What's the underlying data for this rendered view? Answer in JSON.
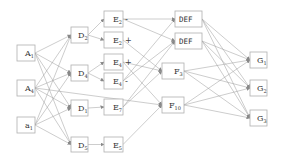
{
  "diagram": {
    "nodes": [
      {
        "id": "A1",
        "base": "A",
        "sub": "1",
        "sign": "",
        "column": 0
      },
      {
        "id": "A4",
        "base": "A",
        "sub": "4",
        "sign": "",
        "column": 0
      },
      {
        "id": "a1",
        "base": "a",
        "sub": "1",
        "sign": "",
        "column": 0
      },
      {
        "id": "D2",
        "base": "D",
        "sub": "2",
        "sign": "",
        "column": 1
      },
      {
        "id": "D4",
        "base": "D",
        "sub": "4",
        "sign": "",
        "column": 1
      },
      {
        "id": "D1",
        "base": "D",
        "sub": "1",
        "sign": "",
        "column": 1
      },
      {
        "id": "D5",
        "base": "D",
        "sub": "5",
        "sign": "",
        "column": 1
      },
      {
        "id": "E2m",
        "base": "E",
        "sub": "2",
        "sign": "-",
        "column": 2
      },
      {
        "id": "E2p",
        "base": "E",
        "sub": "2",
        "sign": "+",
        "column": 2
      },
      {
        "id": "E4p",
        "base": "E",
        "sub": "4",
        "sign": "+",
        "column": 2
      },
      {
        "id": "E4m",
        "base": "E",
        "sub": "4",
        "sign": "-",
        "column": 2
      },
      {
        "id": "E7",
        "base": "E",
        "sub": "7",
        "sign": "",
        "column": 2
      },
      {
        "id": "E5",
        "base": "E",
        "sub": "5",
        "sign": "",
        "column": 2
      },
      {
        "id": "DEF1",
        "base": "DEF",
        "sub": "",
        "sign": "",
        "column": 3
      },
      {
        "id": "DEF2",
        "base": "DEF",
        "sub": "",
        "sign": "",
        "column": 3
      },
      {
        "id": "F3",
        "base": "F",
        "sub": "3",
        "sign": "",
        "column": 3
      },
      {
        "id": "F10",
        "base": "F",
        "sub": "10",
        "sign": "",
        "column": 3
      },
      {
        "id": "G1",
        "base": "G",
        "sub": "1",
        "sign": "",
        "column": 4
      },
      {
        "id": "G2",
        "base": "G",
        "sub": "2",
        "sign": "",
        "column": 4
      },
      {
        "id": "G3",
        "base": "G",
        "sub": "3",
        "sign": "",
        "column": 4
      }
    ],
    "edges": [
      [
        "A1",
        "D2"
      ],
      [
        "A1",
        "D4"
      ],
      [
        "A1",
        "D1"
      ],
      [
        "A1",
        "D5"
      ],
      [
        "A4",
        "D2"
      ],
      [
        "A4",
        "D4"
      ],
      [
        "A4",
        "D1"
      ],
      [
        "A4",
        "D5"
      ],
      [
        "A4",
        "F10"
      ],
      [
        "a1",
        "D2"
      ],
      [
        "a1",
        "D4"
      ],
      [
        "a1",
        "D1"
      ],
      [
        "a1",
        "D5"
      ],
      [
        "D2",
        "E2m"
      ],
      [
        "D2",
        "E2p"
      ],
      [
        "D4",
        "E4p"
      ],
      [
        "D4",
        "E4m"
      ],
      [
        "D1",
        "E7"
      ],
      [
        "D5",
        "E5"
      ],
      [
        "E2m",
        "DEF1"
      ],
      [
        "E2m",
        "DEF2"
      ],
      [
        "E2p",
        "F3"
      ],
      [
        "E4p",
        "F3"
      ],
      [
        "E4p",
        "F10"
      ],
      [
        "E4m",
        "DEF1"
      ],
      [
        "E4m",
        "DEF2"
      ],
      [
        "E7",
        "DEF2"
      ],
      [
        "E7",
        "F3"
      ],
      [
        "E5",
        "F10"
      ],
      [
        "DEF1",
        "G1"
      ],
      [
        "DEF1",
        "G2"
      ],
      [
        "DEF1",
        "G3"
      ],
      [
        "DEF2",
        "G1"
      ],
      [
        "DEF2",
        "G2"
      ],
      [
        "DEF2",
        "G3"
      ],
      [
        "F3",
        "G1"
      ],
      [
        "F3",
        "G2"
      ],
      [
        "F3",
        "G3"
      ],
      [
        "F10",
        "G1"
      ],
      [
        "F10",
        "G2"
      ],
      [
        "F10",
        "G3"
      ]
    ]
  }
}
